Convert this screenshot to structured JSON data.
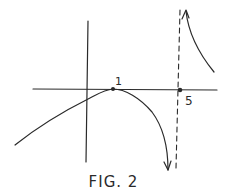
{
  "figure": {
    "caption": "FIG. 2",
    "labels": {
      "point_1": "1",
      "point_5": "5"
    },
    "colors": {
      "ink": "#2a2a2a",
      "background": "#ffffff"
    }
  },
  "diagram": {
    "type": "function-sketch",
    "axes": [
      "x-axis",
      "y-axis"
    ],
    "marked_points": [
      {
        "x": 1,
        "y": 0,
        "label": "1",
        "note": "local maximum touching x-axis"
      },
      {
        "x": 5,
        "y": 0,
        "label": "5",
        "note": "vertical asymptote location"
      }
    ],
    "vertical_asymptote": {
      "x": 5,
      "style": "dashed"
    },
    "branches": [
      {
        "domain": "x < 5",
        "description": "rises from lower left, touches x-axis at x=1, then falls toward -infinity approaching x=5",
        "end_arrow": "down"
      },
      {
        "domain": "x > 5",
        "description": "comes down from +infinity near x=5 and decreases",
        "start_arrow": "up"
      }
    ]
  }
}
